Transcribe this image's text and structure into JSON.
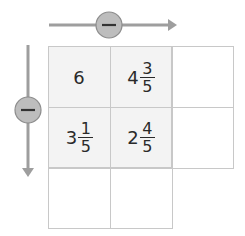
{
  "colors": {
    "arrow": "#9e9e9e",
    "circle_fill": "#bdbdbd",
    "circle_stroke": "#8c8c8c",
    "grid_line": "#c8c8c8",
    "shaded_cell": "#f3f3f3",
    "text": "#2a2a2a"
  },
  "horizontal_operator": {
    "symbol": "minus",
    "direction": "right"
  },
  "vertical_operator": {
    "symbol": "minus",
    "direction": "down"
  },
  "grid": {
    "rows": [
      [
        {
          "whole": "6",
          "num": "",
          "den": ""
        },
        {
          "whole": "4",
          "num": "3",
          "den": "5"
        },
        {
          "whole": "",
          "num": "",
          "den": ""
        }
      ],
      [
        {
          "whole": "3",
          "num": "1",
          "den": "5"
        },
        {
          "whole": "2",
          "num": "4",
          "den": "5"
        },
        {
          "whole": "",
          "num": "",
          "den": ""
        }
      ],
      [
        {
          "whole": "",
          "num": "",
          "den": ""
        },
        {
          "whole": "",
          "num": "",
          "den": ""
        }
      ]
    ]
  }
}
